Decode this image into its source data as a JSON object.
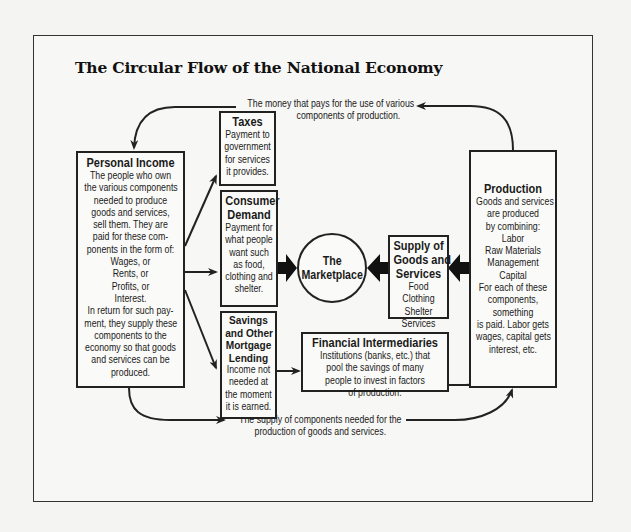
{
  "title": "The Circular Flow of the National Economy",
  "flows": {
    "top_label": [
      "The money that pays for the use of various",
      "components of production."
    ],
    "bottom_label": [
      "The supply of components needed for the",
      "production of goods and services."
    ]
  },
  "boxes": {
    "personal_income": {
      "heading": "Personal Income",
      "lines": [
        "The people who own",
        "the various components",
        "needed to produce",
        "goods and services,",
        "sell them. They are",
        "paid for these com-",
        "ponents in the form of:",
        "Wages, or",
        "Rents, or",
        "Profits, or",
        "Interest.",
        "In return for such pay-",
        "ment, they supply these",
        "components to the",
        "economy so that goods",
        "and services can be",
        "produced."
      ]
    },
    "taxes": {
      "heading": "Taxes",
      "lines": [
        "Payment to",
        "government",
        "for services",
        "it provides."
      ]
    },
    "consumer_demand": {
      "heading": [
        "Consumer",
        "Demand"
      ],
      "lines": [
        "Payment for",
        "what people",
        "want such",
        "as food,",
        "clothing and",
        "shelter."
      ]
    },
    "savings": {
      "heading": [
        "Savings",
        "and Other",
        "Mortgage",
        "Lending"
      ],
      "lines": [
        "Income not",
        "needed at",
        "the moment",
        "it is earned."
      ]
    },
    "marketplace": {
      "lines": [
        "The",
        "Marketplace"
      ]
    },
    "supply": {
      "heading": [
        "Supply of",
        "Goods and",
        "Services"
      ],
      "lines": [
        "Food",
        "Clothing",
        "Shelter",
        "Services"
      ]
    },
    "financial_intermediaries": {
      "heading": "Financial Intermediaries",
      "lines": [
        "Institutions (banks, etc.) that",
        "pool the savings of many",
        "people to invest in factors",
        "of production."
      ]
    },
    "production": {
      "heading": "Production",
      "lines": [
        "Goods and services",
        "are produced",
        "by combining:",
        "Labor",
        "Raw Materials",
        "Management",
        "Capital",
        "For each of these",
        "components,",
        "something",
        "is paid. Labor gets",
        "wages, capital gets",
        "interest, etc."
      ]
    }
  },
  "colors": {
    "line": "#222222",
    "background": "#f7f7f5"
  }
}
